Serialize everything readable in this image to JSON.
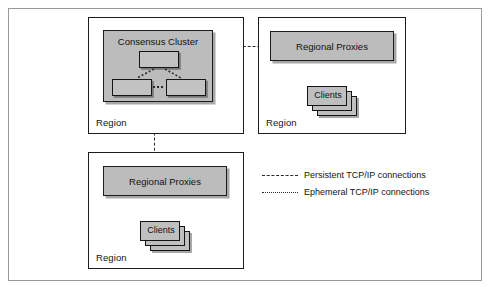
{
  "diagram": {
    "regions": [
      {
        "id": "region-primary",
        "label": "Region"
      },
      {
        "id": "region-east",
        "label": "Region"
      },
      {
        "id": "region-south",
        "label": "Region"
      }
    ],
    "consensus_cluster": {
      "label": "Consensus Cluster",
      "nodes": [
        {
          "id": "node-leader",
          "label": ""
        },
        {
          "id": "node-follower-1",
          "label": ""
        },
        {
          "id": "node-follower-2",
          "label": ""
        }
      ]
    },
    "proxies": [
      {
        "id": "proxies-east",
        "label": "Regional Proxies"
      },
      {
        "id": "proxies-south",
        "label": "Regional Proxies"
      }
    ],
    "clients": [
      {
        "id": "clients-east",
        "label": "Clients"
      },
      {
        "id": "clients-south",
        "label": "Clients"
      }
    ],
    "legend": {
      "items": [
        {
          "style": "dashed",
          "label": "Persistent TCP/IP connections"
        },
        {
          "style": "dotted",
          "label": "Ephemeral TCP/IP connections"
        }
      ]
    },
    "colors": {
      "box_fill": "#bcbcbc",
      "node_fill": "#c2c2c2",
      "stroke": "#1c1c1c",
      "frame": "#9a9a9a",
      "connector": "#2a2a2a"
    }
  }
}
